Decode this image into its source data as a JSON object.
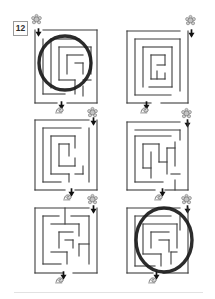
{
  "page": {
    "label_number": "12",
    "background": "#ffffff",
    "edge_shadow_color": "#e2e2e2"
  },
  "style": {
    "wall_color": "#3d3d3d",
    "wall_width": 1.1,
    "circle_color": "#1a1a1a",
    "circle_width": 3.4,
    "arrow_color": "#111111",
    "icon_fill": "#cfcfcf",
    "icon_outline": "#757575"
  },
  "mazes": [
    {
      "name": "maze-1",
      "box": [
        35,
        30,
        62,
        73
      ],
      "start": {
        "side": "top-left",
        "icon": [
          31,
          14
        ],
        "arrow": [
          35,
          23
        ]
      },
      "finish": {
        "side": "bottom-center",
        "icon": [
          54,
          105
        ],
        "arrow": [
          58,
          96
        ]
      },
      "circled": true,
      "circle": [
        65,
        63,
        26,
        27
      ],
      "walls": [
        [
          8,
          0,
          62,
          0
        ],
        [
          0,
          0,
          0,
          73
        ],
        [
          62,
          0,
          62,
          73
        ],
        [
          0,
          73,
          22,
          73
        ],
        [
          32,
          73,
          62,
          73
        ],
        [
          8,
          9,
          8,
          64
        ],
        [
          16,
          9,
          16,
          58
        ],
        [
          16,
          9,
          44,
          9
        ],
        [
          24,
          17,
          56,
          17
        ],
        [
          56,
          17,
          56,
          44
        ],
        [
          24,
          17,
          24,
          50
        ],
        [
          32,
          25,
          48,
          25
        ],
        [
          32,
          25,
          32,
          44
        ],
        [
          40,
          33,
          48,
          33
        ],
        [
          48,
          33,
          48,
          44
        ],
        [
          24,
          50,
          40,
          50
        ],
        [
          40,
          50,
          40,
          64
        ],
        [
          8,
          64,
          30,
          64
        ],
        [
          48,
          50,
          56,
          50
        ],
        [
          48,
          56,
          48,
          66
        ]
      ]
    },
    {
      "name": "maze-2",
      "box": [
        127,
        31,
        61,
        72
      ],
      "start": {
        "side": "top-right",
        "icon": [
          185,
          15
        ],
        "arrow": [
          188,
          24
        ]
      },
      "finish": {
        "side": "bottom-center",
        "icon": [
          139,
          105
        ],
        "arrow": [
          143,
          96
        ]
      },
      "circled": false,
      "circle": null,
      "walls": [
        [
          0,
          0,
          53,
          0
        ],
        [
          0,
          0,
          0,
          72
        ],
        [
          61,
          0,
          61,
          72
        ],
        [
          0,
          72,
          24,
          72
        ],
        [
          34,
          72,
          61,
          72
        ],
        [
          8,
          8,
          53,
          8
        ],
        [
          8,
          8,
          8,
          64
        ],
        [
          53,
          8,
          53,
          60
        ],
        [
          8,
          64,
          44,
          64
        ],
        [
          16,
          16,
          45,
          16
        ],
        [
          16,
          16,
          16,
          56
        ],
        [
          45,
          16,
          45,
          56
        ],
        [
          22,
          56,
          45,
          56
        ],
        [
          24,
          24,
          38,
          24
        ],
        [
          24,
          24,
          24,
          48
        ],
        [
          38,
          24,
          38,
          34
        ],
        [
          30,
          34,
          38,
          34
        ],
        [
          30,
          40,
          30,
          48
        ],
        [
          24,
          48,
          38,
          48
        ],
        [
          38,
          42,
          38,
          48
        ]
      ]
    },
    {
      "name": "maze-3",
      "box": [
        35,
        120,
        62,
        70
      ],
      "start": {
        "side": "top-right",
        "icon": [
          87,
          107
        ],
        "arrow": [
          90,
          112
        ]
      },
      "finish": {
        "side": "bottom-center",
        "icon": [
          62,
          192
        ],
        "arrow": [
          68,
          183
        ]
      },
      "circled": false,
      "circle": null,
      "walls": [
        [
          0,
          0,
          54,
          0
        ],
        [
          0,
          0,
          0,
          70
        ],
        [
          62,
          0,
          62,
          70
        ],
        [
          0,
          70,
          30,
          70
        ],
        [
          40,
          70,
          62,
          70
        ],
        [
          54,
          8,
          54,
          62
        ],
        [
          8,
          8,
          46,
          8
        ],
        [
          8,
          8,
          8,
          62
        ],
        [
          8,
          62,
          26,
          62
        ],
        [
          16,
          16,
          16,
          54
        ],
        [
          16,
          16,
          40,
          16
        ],
        [
          40,
          16,
          40,
          28
        ],
        [
          24,
          24,
          34,
          24
        ],
        [
          24,
          24,
          24,
          46
        ],
        [
          34,
          24,
          34,
          36
        ],
        [
          24,
          46,
          40,
          46
        ],
        [
          40,
          38,
          40,
          46
        ],
        [
          16,
          54,
          34,
          54
        ],
        [
          34,
          54,
          34,
          62
        ],
        [
          40,
          54,
          48,
          54
        ],
        [
          48,
          46,
          48,
          54
        ]
      ]
    },
    {
      "name": "maze-4",
      "box": [
        127,
        122,
        61,
        68
      ],
      "start": {
        "side": "top-right",
        "icon": [
          181,
          108
        ],
        "arrow": [
          184,
          114
        ]
      },
      "finish": {
        "side": "bottom-center",
        "icon": [
          153,
          192
        ],
        "arrow": [
          159,
          183
        ]
      },
      "circled": false,
      "circle": null,
      "walls": [
        [
          0,
          0,
          53,
          0
        ],
        [
          0,
          0,
          0,
          68
        ],
        [
          61,
          0,
          61,
          68
        ],
        [
          0,
          68,
          28,
          68
        ],
        [
          38,
          68,
          61,
          68
        ],
        [
          8,
          8,
          53,
          8
        ],
        [
          53,
          8,
          53,
          18
        ],
        [
          8,
          14,
          44,
          14
        ],
        [
          8,
          14,
          8,
          60
        ],
        [
          16,
          22,
          16,
          46
        ],
        [
          24,
          30,
          24,
          56
        ],
        [
          32,
          22,
          32,
          40
        ],
        [
          40,
          26,
          40,
          52
        ],
        [
          48,
          20,
          48,
          44
        ],
        [
          16,
          22,
          32,
          22
        ],
        [
          40,
          26,
          48,
          26
        ],
        [
          16,
          46,
          24,
          46
        ],
        [
          32,
          40,
          40,
          40
        ],
        [
          8,
          60,
          36,
          60
        ],
        [
          44,
          52,
          53,
          52
        ],
        [
          48,
          58,
          48,
          68
        ]
      ]
    },
    {
      "name": "maze-5",
      "box": [
        35,
        208,
        62,
        65
      ],
      "start": {
        "side": "top-right",
        "icon": [
          87,
          194
        ],
        "arrow": [
          90,
          200
        ]
      },
      "finish": {
        "side": "bottom-center",
        "icon": [
          54,
          275
        ],
        "arrow": [
          60,
          266
        ]
      },
      "circled": false,
      "circle": null,
      "walls": [
        [
          0,
          0,
          54,
          0
        ],
        [
          0,
          0,
          0,
          65
        ],
        [
          62,
          0,
          62,
          65
        ],
        [
          0,
          65,
          28,
          65
        ],
        [
          38,
          65,
          62,
          65
        ],
        [
          30,
          0,
          30,
          16
        ],
        [
          8,
          8,
          24,
          8
        ],
        [
          36,
          8,
          54,
          8
        ],
        [
          54,
          8,
          54,
          56
        ],
        [
          8,
          8,
          8,
          56
        ],
        [
          8,
          56,
          26,
          56
        ],
        [
          16,
          16,
          44,
          16
        ],
        [
          44,
          16,
          44,
          28
        ],
        [
          24,
          24,
          38,
          24
        ],
        [
          24,
          24,
          24,
          40
        ],
        [
          30,
          32,
          38,
          32
        ],
        [
          38,
          32,
          38,
          40
        ],
        [
          44,
          36,
          54,
          36
        ],
        [
          44,
          36,
          44,
          48
        ],
        [
          16,
          44,
          32,
          44
        ],
        [
          32,
          44,
          32,
          56
        ]
      ]
    },
    {
      "name": "maze-6",
      "box": [
        127,
        208,
        61,
        65
      ],
      "start": {
        "side": "top-right",
        "icon": [
          181,
          194
        ],
        "arrow": [
          184,
          200
        ]
      },
      "finish": {
        "side": "bottom-center",
        "icon": [
          147,
          275
        ],
        "arrow": [
          153,
          266
        ]
      },
      "circled": true,
      "circle": [
        164,
        240,
        28,
        32
      ],
      "walls": [
        [
          0,
          0,
          53,
          0
        ],
        [
          0,
          0,
          0,
          65
        ],
        [
          61,
          0,
          61,
          65
        ],
        [
          0,
          65,
          26,
          65
        ],
        [
          36,
          65,
          61,
          65
        ],
        [
          8,
          8,
          8,
          58
        ],
        [
          8,
          8,
          44,
          8
        ],
        [
          53,
          8,
          53,
          22
        ],
        [
          16,
          16,
          50,
          16
        ],
        [
          50,
          16,
          50,
          40
        ],
        [
          16,
          16,
          16,
          46
        ],
        [
          24,
          24,
          42,
          24
        ],
        [
          24,
          24,
          24,
          40
        ],
        [
          32,
          32,
          42,
          32
        ],
        [
          42,
          32,
          42,
          44
        ],
        [
          16,
          46,
          34,
          46
        ],
        [
          34,
          46,
          34,
          58
        ],
        [
          8,
          58,
          28,
          58
        ],
        [
          44,
          44,
          50,
          44
        ],
        [
          44,
          44,
          44,
          56
        ]
      ]
    }
  ]
}
